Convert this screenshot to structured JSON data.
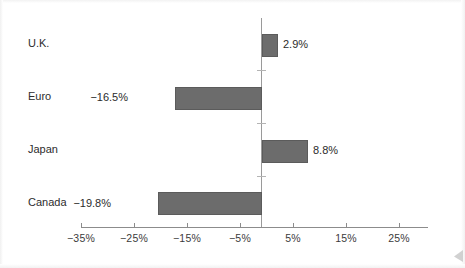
{
  "chart_data": {
    "type": "bar",
    "orientation": "horizontal",
    "title": "",
    "subtitle": "",
    "xlabel": "",
    "ylabel": "",
    "categories": [
      "U.K.",
      "Euro",
      "Japan",
      "Canada"
    ],
    "values": [
      2.9,
      -16.5,
      8.8,
      -19.8
    ],
    "value_labels": [
      "2.9%",
      "−16.5%",
      "8.8%",
      "−19.8%"
    ],
    "series": [
      {
        "name": "",
        "values": [
          2.9,
          -16.5,
          8.8,
          -19.8
        ]
      }
    ],
    "xlim": [
      -35,
      30
    ],
    "xticks": [
      -35,
      -25,
      -15,
      -5,
      5,
      15,
      25
    ],
    "xtick_labels": [
      "−35%",
      "−25%",
      "−15%",
      "−5%",
      "5%",
      "15%",
      "25%"
    ],
    "grid": false,
    "legend": null,
    "legend_position": "none",
    "zero_line": true,
    "bar_color": "#6c6c6c",
    "bar_edge_color": "#5b5b5b",
    "axis_color": "#8c8c8c",
    "text_color": "#2d2d2d",
    "background_color": "#ffffff"
  },
  "axis": {
    "ticks": [
      {
        "label": "−35%",
        "value": -35,
        "x": 81
      },
      {
        "label": "−25%",
        "value": -25,
        "x": 134
      },
      {
        "label": "−15%",
        "value": -15,
        "x": 187
      },
      {
        "label": "−5%",
        "value": -5,
        "x": 240
      },
      {
        "label": "5%",
        "value": 5,
        "x": 293
      },
      {
        "label": "15%",
        "value": 15,
        "x": 346
      },
      {
        "label": "25%",
        "value": 25,
        "x": 399
      }
    ]
  },
  "bars": [
    {
      "category": "U.K.",
      "value_label": "2.9%",
      "label_y": 37,
      "bar_top": 34,
      "bar_left": 262,
      "bar_width": 16,
      "value_x": 283,
      "value_y": 38,
      "sign": "pos"
    },
    {
      "category": "Euro",
      "value_label": "−16.5%",
      "label_y": 90,
      "bar_top": 87,
      "bar_left": 175,
      "bar_width": 87,
      "value_x": 128,
      "value_y": 91,
      "sign": "neg"
    },
    {
      "category": "Japan",
      "value_label": "8.8%",
      "label_y": 143,
      "bar_top": 140,
      "bar_left": 262,
      "bar_width": 46,
      "value_x": 313,
      "value_y": 144,
      "sign": "pos"
    },
    {
      "category": "Canada",
      "value_label": "−19.8%",
      "label_y": 196,
      "bar_top": 192,
      "bar_left": 158,
      "bar_width": 104,
      "value_x": 111,
      "value_y": 197,
      "sign": "neg"
    }
  ],
  "zero_stubs_y": [
    70,
    123,
    176
  ]
}
